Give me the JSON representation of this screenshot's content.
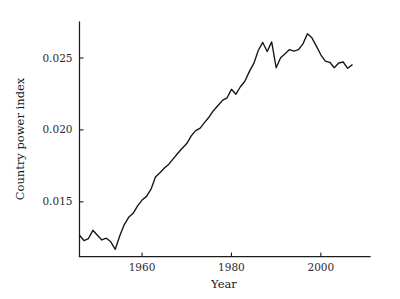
{
  "chart_data": {
    "type": "line",
    "title": "",
    "xlabel": "Year",
    "ylabel": "Country power index",
    "xlim": [
      1946,
      2011
    ],
    "ylim": [
      0.0112,
      0.0275
    ],
    "grid": false,
    "legend": false,
    "legend_position": "none",
    "xticks": [
      1960,
      1980,
      2000
    ],
    "xtick_labels": [
      "1960",
      "1980",
      "2000"
    ],
    "yticks": [
      0.015,
      0.02,
      0.025
    ],
    "ytick_labels": [
      "0.015",
      "0.020",
      "0.025"
    ],
    "line_color": "#141414",
    "series": [
      {
        "name": "Country power index",
        "x": [
          1946,
          1947,
          1948,
          1949,
          1950,
          1951,
          1952,
          1953,
          1954,
          1955,
          1956,
          1957,
          1958,
          1959,
          1960,
          1961,
          1962,
          1963,
          1964,
          1965,
          1966,
          1967,
          1968,
          1969,
          1970,
          1971,
          1972,
          1973,
          1974,
          1975,
          1976,
          1977,
          1978,
          1979,
          1980,
          1981,
          1982,
          1983,
          1984,
          1985,
          1986,
          1987,
          1988,
          1989,
          1990,
          1991,
          1992,
          1993,
          1994,
          1995,
          1996,
          1997,
          1998,
          1999,
          2000,
          2001,
          2002,
          2003,
          2004,
          2005,
          2006,
          2007
        ],
        "values": [
          0.01268,
          0.01231,
          0.01245,
          0.01302,
          0.01268,
          0.01235,
          0.01247,
          0.01222,
          0.0117,
          0.01262,
          0.0134,
          0.01392,
          0.0142,
          0.01472,
          0.01512,
          0.01538,
          0.01588,
          0.01672,
          0.01702,
          0.01735,
          0.01762,
          0.018,
          0.01838,
          0.01872,
          0.01905,
          0.01958,
          0.01995,
          0.02012,
          0.02052,
          0.0209,
          0.02135,
          0.0217,
          0.02205,
          0.02222,
          0.02282,
          0.02248,
          0.023,
          0.02338,
          0.02405,
          0.02462,
          0.02552,
          0.02608,
          0.02545,
          0.02612,
          0.02432,
          0.02502,
          0.0253,
          0.02558,
          0.02548,
          0.02558,
          0.02598,
          0.02668,
          0.0264,
          0.02582,
          0.02522,
          0.02478,
          0.0247,
          0.02432,
          0.02465,
          0.02472,
          0.02428,
          0.02452
        ]
      }
    ]
  },
  "axes": {
    "x_title": "Year",
    "y_title": "Country power index"
  }
}
